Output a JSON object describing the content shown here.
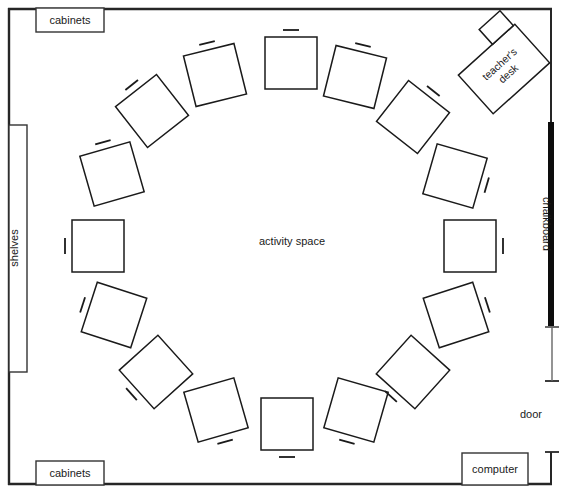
{
  "diagram": {
    "room": {
      "wall_color": "#262626",
      "wall_thickness": 2,
      "x": 8,
      "y": 8,
      "width": 544,
      "height": 477
    },
    "center_label": "activity space",
    "fixtures": [
      {
        "id": "cabinets-top",
        "label": "cabinets",
        "x": 36,
        "y": 8,
        "width": 68,
        "height": 24,
        "label_x": 70,
        "label_y": 24
      },
      {
        "id": "shelves-left",
        "label": "shelves",
        "x": 8,
        "y": 125,
        "width": 19,
        "height": 247,
        "label_x": 18,
        "label_y": 248,
        "rotated": true
      },
      {
        "id": "cabinets-bottom",
        "label": "cabinets",
        "x": 36,
        "y": 461,
        "width": 68,
        "height": 24,
        "label_x": 70,
        "label_y": 477
      },
      {
        "id": "computer-bottom-right",
        "label": "computer",
        "x": 462,
        "y": 453,
        "width": 66,
        "height": 32,
        "label_x": 495,
        "label_y": 473
      }
    ],
    "chalkboard": {
      "label": "chalkboard",
      "color": "#000000",
      "x": 548,
      "y": 122,
      "width": 6,
      "height": 204,
      "label_x": 543,
      "label_y": 224
    },
    "door": {
      "label": "door",
      "label_x": 542,
      "label_y": 418,
      "gap_top_y": 326,
      "gap_bottom_y": 382,
      "cap_x1": 545,
      "cap_x2": 559,
      "wall_x": 552,
      "second_cap_y": 452
    },
    "teacher_desk": {
      "label_line1": "teacher's",
      "label_line2": "desk",
      "cx": 504,
      "cy": 69,
      "width": 76,
      "height": 52,
      "rotation": -42,
      "chair": {
        "x": 10,
        "y": -40,
        "width": 28,
        "height": 20
      }
    },
    "student_desks": [
      {
        "id": "desk-1",
        "cx": 291,
        "cy": 63,
        "size": 52,
        "rotation": 0,
        "chair_angle": -90
      },
      {
        "id": "desk-2",
        "cx": 215,
        "cy": 75,
        "size": 52,
        "rotation": -14,
        "chair_angle": -90
      },
      {
        "id": "desk-3",
        "cx": 152,
        "cy": 111,
        "size": 52,
        "rotation": -38,
        "chair_angle": -90
      },
      {
        "id": "desk-4",
        "cx": 112,
        "cy": 174,
        "size": 52,
        "rotation": -16,
        "chair_angle": -90
      },
      {
        "id": "desk-5",
        "cx": 98,
        "cy": 246,
        "size": 52,
        "rotation": 0,
        "chair_angle": 180
      },
      {
        "id": "desk-6",
        "cx": 114,
        "cy": 315,
        "size": 52,
        "rotation": 18,
        "chair_angle": 180
      },
      {
        "id": "desk-7",
        "cx": 156,
        "cy": 372,
        "size": 52,
        "rotation": -42,
        "chair_angle": 180
      },
      {
        "id": "desk-8",
        "cx": 216,
        "cy": 410,
        "size": 52,
        "rotation": -16,
        "chair_angle": 90
      },
      {
        "id": "desk-9",
        "cx": 287,
        "cy": 424,
        "size": 52,
        "rotation": 0,
        "chair_angle": 90
      },
      {
        "id": "desk-10",
        "cx": 356,
        "cy": 410,
        "size": 52,
        "rotation": 16,
        "chair_angle": 90
      },
      {
        "id": "desk-11",
        "cx": 413,
        "cy": 372,
        "size": 52,
        "rotation": 42,
        "chair_angle": 90
      },
      {
        "id": "desk-12",
        "cx": 456,
        "cy": 315,
        "size": 52,
        "rotation": -18,
        "chair_angle": 0
      },
      {
        "id": "desk-13",
        "cx": 470,
        "cy": 246,
        "size": 52,
        "rotation": 0,
        "chair_angle": 0
      },
      {
        "id": "desk-14",
        "cx": 455,
        "cy": 176,
        "size": 52,
        "rotation": 16,
        "chair_angle": 0
      },
      {
        "id": "desk-15",
        "cx": 413,
        "cy": 117,
        "size": 52,
        "rotation": 38,
        "chair_angle": -90
      },
      {
        "id": "desk-16",
        "cx": 355,
        "cy": 77,
        "size": 52,
        "rotation": 14,
        "chair_angle": -90
      }
    ]
  }
}
